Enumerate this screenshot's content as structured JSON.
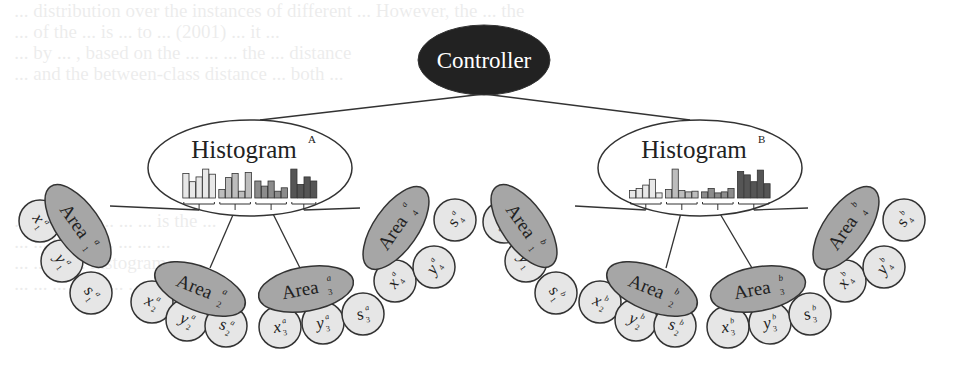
{
  "ghost_text": [
    "   ... distribution over the instances of different ... However, the ... the",
    "   ... of the ... is ... to ... (2001) ... it ...",
    "   ... by ... , based on the ... ... ... the ... distance",
    "   ... and the between-class distance ... both ...",
    "",
    "",
    "",
    "",
    "",
    "",
    "   ... the ... in ... ... ... is the ...",
    "   ... ... the ... ... ... ... ...",
    "   ... ... ... ... histogram ... ...",
    "   ... ... ... ... ... ... ... ... ..."
  ],
  "colors": {
    "controller_fill": "#222222",
    "controller_text": "#ffffff",
    "histogram_fill": "#ffffff",
    "area_fill": "#a6a6a6",
    "leaf_fill": "#e6e6e6",
    "stroke": "#333333",
    "bar_shades": [
      "#e8e8e8",
      "#bdbdbd",
      "#8c8c8c",
      "#555555"
    ]
  },
  "controller": {
    "label": "Controller"
  },
  "histograms": [
    {
      "id": "A",
      "label": "Histogram",
      "superscript": "A",
      "bar_groups": [
        [
          0.72,
          0.48,
          0.62,
          0.85,
          0.7
        ],
        [
          0.25,
          0.6,
          0.72,
          0.2,
          0.75
        ],
        [
          0.5,
          0.35,
          0.5,
          0.2,
          0.3
        ],
        [
          0.85,
          0.4,
          0.62,
          0.5
        ]
      ]
    },
    {
      "id": "B",
      "label": "Histogram",
      "superscript": "B",
      "bar_groups": [
        [
          0.22,
          0.28,
          0.38,
          0.55,
          0.15
        ],
        [
          0.25,
          0.85,
          0.22,
          0.18,
          0.2
        ],
        [
          0.18,
          0.28,
          0.15,
          0.18,
          0.28
        ],
        [
          0.78,
          0.68,
          0.48,
          0.82,
          0.42
        ]
      ]
    }
  ],
  "areas": [
    {
      "group": "A",
      "sup": "a",
      "index": "1",
      "label": "Area",
      "leaves": [
        {
          "var": "x",
          "sub": "1",
          "sup": "a"
        },
        {
          "var": "y",
          "sub": "1",
          "sup": "a"
        },
        {
          "var": "s",
          "sub": "1",
          "sup": "a"
        }
      ]
    },
    {
      "group": "A",
      "sup": "a",
      "index": "2",
      "label": "Area",
      "leaves": [
        {
          "var": "x",
          "sub": "2",
          "sup": "a"
        },
        {
          "var": "y",
          "sub": "2",
          "sup": "a"
        },
        {
          "var": "s",
          "sub": "2",
          "sup": "a"
        }
      ]
    },
    {
      "group": "A",
      "sup": "a",
      "index": "3",
      "label": "Area",
      "leaves": [
        {
          "var": "x",
          "sub": "3",
          "sup": "a"
        },
        {
          "var": "y",
          "sub": "3",
          "sup": "a"
        },
        {
          "var": "s",
          "sub": "3",
          "sup": "a"
        }
      ]
    },
    {
      "group": "A",
      "sup": "a",
      "index": "4",
      "label": "Area",
      "leaves": [
        {
          "var": "x",
          "sub": "4",
          "sup": "a"
        },
        {
          "var": "y",
          "sub": "4",
          "sup": "a"
        },
        {
          "var": "s",
          "sub": "4",
          "sup": "a"
        }
      ]
    },
    {
      "group": "B",
      "sup": "b",
      "index": "1",
      "label": "Area",
      "leaves": [
        {
          "var": "x",
          "sub": "1",
          "sup": "b"
        },
        {
          "var": "y",
          "sub": "1",
          "sup": "b"
        },
        {
          "var": "s",
          "sub": "1",
          "sup": "b"
        }
      ]
    },
    {
      "group": "B",
      "sup": "b",
      "index": "2",
      "label": "Area",
      "leaves": [
        {
          "var": "x",
          "sub": "2",
          "sup": "b"
        },
        {
          "var": "y",
          "sub": "2",
          "sup": "b"
        },
        {
          "var": "s",
          "sub": "2",
          "sup": "b"
        }
      ]
    },
    {
      "group": "B",
      "sup": "b",
      "index": "3",
      "label": "Area",
      "leaves": [
        {
          "var": "x",
          "sub": "3",
          "sup": "b"
        },
        {
          "var": "y",
          "sub": "3",
          "sup": "b"
        },
        {
          "var": "s",
          "sub": "3",
          "sup": "b"
        }
      ]
    },
    {
      "group": "B",
      "sup": "b",
      "index": "4",
      "label": "Area",
      "leaves": [
        {
          "var": "x",
          "sub": "4",
          "sup": "b"
        },
        {
          "var": "y",
          "sub": "4",
          "sup": "b"
        },
        {
          "var": "s",
          "sub": "4",
          "sup": "b"
        }
      ]
    }
  ]
}
